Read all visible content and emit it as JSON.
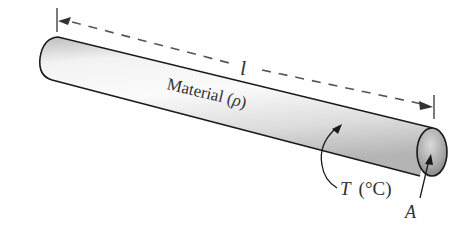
{
  "diagram": {
    "labels": {
      "length": "l",
      "material": "Material (",
      "rho": "ρ",
      "material_close": ")",
      "temperature": "T",
      "temperature_unit": "(°C)",
      "area": "A"
    },
    "colors": {
      "outline": "#1a1a1a",
      "dash": "#555555",
      "bar_light": "#f4f4f4",
      "bar_mid": "#d6d6d6",
      "bar_dark": "#a8a8a8",
      "cap": "#9a9a9a",
      "text": "#333333"
    }
  }
}
